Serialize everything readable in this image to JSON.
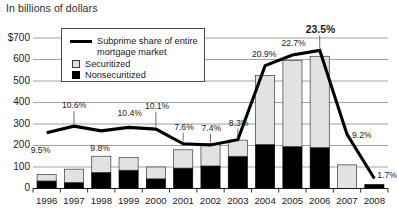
{
  "header": {
    "axis_note": "In billions of dollars"
  },
  "legend": {
    "line_label_1": "Subprime share of entire",
    "line_label_2": "mortgage market",
    "securitized_label": "Securitized",
    "nonsecuritized_label": "Nonsecuritized"
  },
  "colors": {
    "securitized": "#e2e2e2",
    "nonsecuritized": "#000000",
    "line": "#000000",
    "grid": "#8a8a8a",
    "axis": "#1a1a1a"
  },
  "chart_data": {
    "type": "bar",
    "title": "In billions of dollars",
    "xlabel": "",
    "ylabel": "In billions of dollars",
    "ylim": [
      0,
      700
    ],
    "yticks": [
      0,
      100,
      200,
      300,
      400,
      500,
      600,
      700
    ],
    "ytick_labels": [
      "0",
      "100",
      "200",
      "300",
      "400",
      "500",
      "600",
      "$700"
    ],
    "grid": true,
    "legend_position": "top-left-inset",
    "stacked": true,
    "categories": [
      "1996",
      "1997",
      "1998",
      "1999",
      "2000",
      "2001",
      "2002",
      "2003",
      "2004",
      "2005",
      "2006",
      "2007",
      "2008"
    ],
    "series": [
      {
        "name": "Nonsecuritized",
        "values": [
          35,
          28,
          75,
          85,
          45,
          95,
          105,
          150,
          205,
          195,
          190,
          0,
          18
        ]
      },
      {
        "name": "Securitized",
        "values": [
          30,
          62,
          75,
          60,
          55,
          85,
          105,
          75,
          320,
          400,
          425,
          110,
          0
        ]
      }
    ],
    "bar_totals": [
      65,
      90,
      150,
      145,
      100,
      180,
      210,
      225,
      525,
      595,
      615,
      110,
      18
    ],
    "line_series": {
      "name": "Subprime share of entire mortgage market",
      "unit": "%",
      "values": [
        9.5,
        10.6,
        9.8,
        10.4,
        10.1,
        7.6,
        7.4,
        8.3,
        20.9,
        22.7,
        23.5,
        9.2,
        1.7
      ],
      "labels": [
        "9.5%",
        "10.6%",
        "9.8%",
        "10.4%",
        "10.1%",
        "7.6%",
        "7.4%",
        "8.3%",
        "20.9%",
        "22.7%",
        "23.5%",
        "9.2%",
        "1.7%"
      ],
      "emphasized_label": "23.5%"
    }
  }
}
